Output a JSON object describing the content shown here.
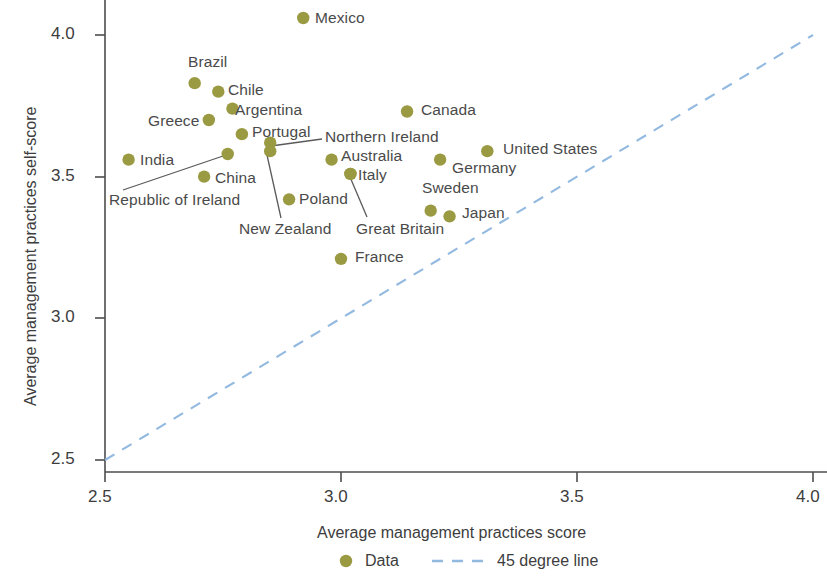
{
  "chart_data": {
    "type": "scatter",
    "title": "",
    "xlabel": "Average management practices score",
    "ylabel": "Average management practices self-score",
    "xlim": [
      2.5,
      4.0
    ],
    "ylim": [
      2.5,
      4.1
    ],
    "xticks": [
      "2.5",
      "3.0",
      "3.5",
      "4.0"
    ],
    "xtick_values": [
      2.5,
      3.0,
      3.5,
      4.0
    ],
    "yticks": [
      "2.5",
      "3.0",
      "3.5",
      "4.0"
    ],
    "ytick_values": [
      2.5,
      3.0,
      3.5,
      4.0
    ],
    "grid": false,
    "legend_position": "bottom",
    "series": [
      {
        "name": "Data",
        "marker": "circle",
        "color": "#9a9a42",
        "points": [
          {
            "label": "Mexico",
            "x": 2.92,
            "y": 4.06,
            "label_pos": "right"
          },
          {
            "label": "Brazil",
            "x": 2.69,
            "y": 3.83,
            "label_pos": "above"
          },
          {
            "label": "Chile",
            "x": 2.74,
            "y": 3.8,
            "label_pos": "right"
          },
          {
            "label": "Argentina",
            "x": 2.77,
            "y": 3.74,
            "label_pos": "right"
          },
          {
            "label": "Greece",
            "x": 2.72,
            "y": 3.7,
            "label_pos": "left"
          },
          {
            "label": "Portugal",
            "x": 2.79,
            "y": 3.65,
            "label_pos": "right"
          },
          {
            "label": "Canada",
            "x": 3.14,
            "y": 3.73,
            "label_pos": "right"
          },
          {
            "label": "United States",
            "x": 3.31,
            "y": 3.59,
            "label_pos": "right"
          },
          {
            "label": "India",
            "x": 2.55,
            "y": 3.56,
            "label_pos": "right"
          },
          {
            "label": "Republic of Ireland",
            "x": 2.76,
            "y": 3.58,
            "label_pos": "leader"
          },
          {
            "label": "Northern Ireland",
            "x": 2.85,
            "y": 3.62,
            "label_pos": "leader"
          },
          {
            "label": "New Zealand",
            "x": 2.85,
            "y": 3.59,
            "label_pos": "leader"
          },
          {
            "label": "Australia",
            "x": 2.98,
            "y": 3.56,
            "label_pos": "right"
          },
          {
            "label": "Germany",
            "x": 3.21,
            "y": 3.56,
            "label_pos": "right"
          },
          {
            "label": "China",
            "x": 2.71,
            "y": 3.5,
            "label_pos": "right"
          },
          {
            "label": "Italy",
            "x": 3.02,
            "y": 3.51,
            "label_pos": "right"
          },
          {
            "label": "Great Britain",
            "x": 3.02,
            "y": 3.51,
            "label_pos": "leader"
          },
          {
            "label": "Poland",
            "x": 2.89,
            "y": 3.42,
            "label_pos": "right"
          },
          {
            "label": "Sweden",
            "x": 3.19,
            "y": 3.38,
            "label_pos": "above"
          },
          {
            "label": "Japan",
            "x": 3.23,
            "y": 3.36,
            "label_pos": "right"
          },
          {
            "label": "France",
            "x": 3.0,
            "y": 3.21,
            "label_pos": "right"
          }
        ]
      },
      {
        "name": "45 degree line",
        "type": "line",
        "style": "dashed",
        "color": "#92b9e0",
        "x": [
          2.5,
          4.0
        ],
        "y": [
          2.5,
          4.0
        ]
      }
    ]
  },
  "axes": {
    "x_title": "Average management practices score",
    "y_title": "Average management practices self-score",
    "x_tick_labels": [
      "2.5",
      "3.0",
      "3.5",
      "4.0"
    ],
    "y_tick_labels": [
      "4.0",
      "3.5",
      "3.0",
      "2.5"
    ]
  },
  "labels": {
    "mexico": "Mexico",
    "brazil": "Brazil",
    "chile": "Chile",
    "argentina": "Argentina",
    "greece": "Greece",
    "portugal": "Portugal",
    "canada": "Canada",
    "united_states": "United States",
    "india": "India",
    "republic_of_ireland": "Republic of Ireland",
    "northern_ireland": "Northern Ireland",
    "new_zealand": "New Zealand",
    "australia": "Australia",
    "germany": "Germany",
    "china": "China",
    "italy": "Italy",
    "great_britain": "Great Britain",
    "poland": "Poland",
    "sweden": "Sweden",
    "japan": "Japan",
    "france": "France"
  },
  "legend": {
    "data_label": "Data",
    "line_label": "45 degree line",
    "marker_color": "#9a9a42",
    "line_color": "#92b9e0"
  },
  "colors": {
    "marker": "#9a9a42",
    "diagonal_line": "#92b9e0",
    "axis": "#4d4d4d",
    "text": "#3d3d3d"
  }
}
